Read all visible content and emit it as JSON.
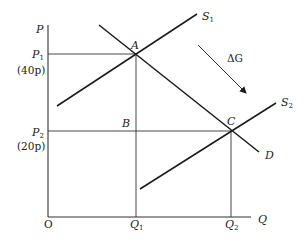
{
  "diagram": {
    "axes": {
      "y_label": "P",
      "x_label": "Q",
      "origin_label": "O"
    },
    "price_levels": [
      {
        "symbol": "P",
        "subscript": "1",
        "value_label": "(40p)"
      },
      {
        "symbol": "P",
        "subscript": "2",
        "value_label": "(20p)"
      }
    ],
    "quantity_levels": [
      {
        "symbol": "Q",
        "subscript": "1"
      },
      {
        "symbol": "Q",
        "subscript": "2"
      }
    ],
    "curves": [
      {
        "id": "S1",
        "symbol": "S",
        "subscript": "1",
        "type": "supply"
      },
      {
        "id": "S2",
        "symbol": "S",
        "subscript": "2",
        "type": "supply"
      },
      {
        "id": "D",
        "symbol": "D",
        "subscript": "",
        "type": "demand"
      }
    ],
    "points": [
      {
        "id": "A",
        "label": "A",
        "desc": "Intersection of S1 and D at P1, Q1"
      },
      {
        "id": "B",
        "label": "B",
        "desc": "Point at P2, Q1"
      },
      {
        "id": "C",
        "label": "C",
        "desc": "Intersection of S2 and D at P2, Q2"
      }
    ],
    "annotations": [
      {
        "id": "delta-g",
        "label": "ΔG",
        "desc": "Arrow showing shift of supply from S1 to S2"
      }
    ],
    "colors": {
      "line": "#1a1a1a",
      "guide": "#333333",
      "background": "#ffffff"
    }
  }
}
